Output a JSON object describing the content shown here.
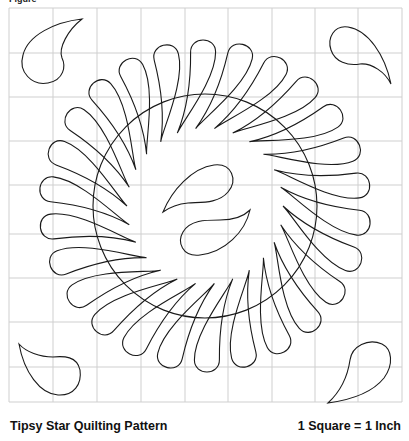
{
  "figure": {
    "label": "Figure",
    "title": "Tipsy Star Quilting Pattern",
    "scale_note": "1 Square = 1 Inch"
  },
  "grid": {
    "columns": 9,
    "rows": 9,
    "x_lines": [
      9,
      53,
      97,
      141,
      185,
      228,
      272,
      315,
      358,
      402
    ],
    "y_lines": [
      8,
      53,
      97,
      141,
      185,
      234,
      278,
      322,
      367,
      402
    ],
    "line_color": "#cfcfcf",
    "stroke_color": "#1a1a1a"
  },
  "motif": {
    "center": [
      205,
      206
    ],
    "inner_ring_radius": 118,
    "feather_count": 26,
    "feather_length": 72,
    "feather_width": 25
  }
}
